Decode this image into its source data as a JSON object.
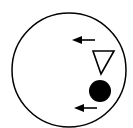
{
  "diagram": {
    "colors": {
      "stroke": "#000000",
      "fill": "#000000",
      "background": "#ffffff"
    },
    "elements": [
      {
        "type": "circle",
        "name": "outer-circle"
      },
      {
        "type": "arrow",
        "direction": "left",
        "name": "arrow-upper"
      },
      {
        "type": "triangle",
        "orientation": "down",
        "filled": false,
        "name": "open-triangle"
      },
      {
        "type": "dot",
        "filled": true,
        "name": "filled-dot"
      },
      {
        "type": "arrow",
        "direction": "left",
        "name": "arrow-lower"
      }
    ]
  }
}
